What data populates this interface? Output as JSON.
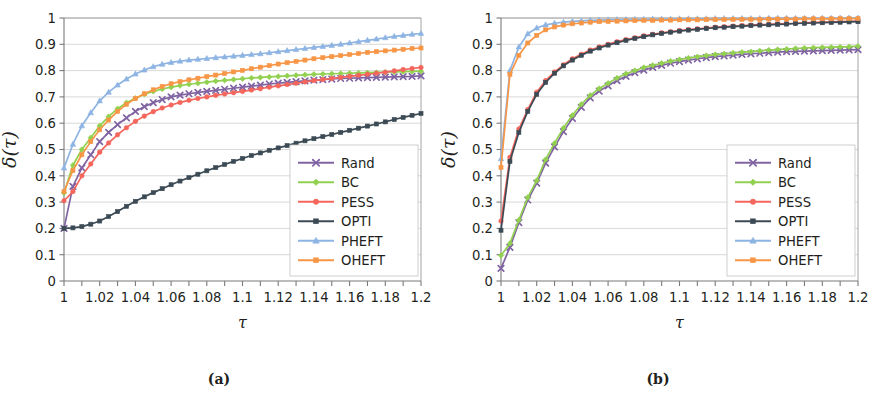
{
  "figure": {
    "panels": [
      {
        "id": "a",
        "caption": "(a)"
      },
      {
        "id": "b",
        "caption": "(b)"
      }
    ]
  },
  "axes": {
    "xlabel": "τ",
    "ylabel": "δ(τ)",
    "x_tick_labels": [
      "1",
      "1.02",
      "1.04",
      "1.06",
      "1.08",
      "1.1",
      "1.12",
      "1.14",
      "1.16",
      "1.18",
      "1.2"
    ],
    "x_tick_values": [
      1,
      1.02,
      1.04,
      1.06,
      1.08,
      1.1,
      1.12,
      1.14,
      1.16,
      1.18,
      1.2
    ],
    "y_tick_labels": [
      "0",
      "0.1",
      "0.2",
      "0.3",
      "0.4",
      "0.5",
      "0.6",
      "0.7",
      "0.8",
      "0.9",
      "1"
    ],
    "y_tick_values": [
      0,
      0.1,
      0.2,
      0.3,
      0.4,
      0.5,
      0.6,
      0.7,
      0.8,
      0.9,
      1
    ],
    "xlim": [
      1,
      1.2
    ],
    "ylim": [
      0,
      1
    ],
    "minor_x_step": 0.01
  },
  "legend": {
    "position": "bottom-right",
    "entries": [
      {
        "label": "Rand",
        "color": "#8064a2",
        "marker": "x"
      },
      {
        "label": "BC",
        "color": "#92d050",
        "marker": "diamond"
      },
      {
        "label": "PESS",
        "color": "#f4665c",
        "marker": "circle"
      },
      {
        "label": "OPTI",
        "color": "#3b4a54",
        "marker": "square"
      },
      {
        "label": "PHEFT",
        "color": "#8db4e2",
        "marker": "triangle"
      },
      {
        "label": "OHEFT",
        "color": "#f79646",
        "marker": "square"
      }
    ]
  },
  "chart_data": [
    {
      "type": "line",
      "panel": "(a)",
      "title": "",
      "xlabel": "τ",
      "ylabel": "δ(τ)",
      "xlim": [
        1,
        1.2
      ],
      "ylim": [
        0,
        1
      ],
      "grid": true,
      "legend_position": "bottom-right",
      "x": [
        1,
        1.005,
        1.01,
        1.015,
        1.02,
        1.025,
        1.03,
        1.035,
        1.04,
        1.045,
        1.05,
        1.055,
        1.06,
        1.065,
        1.07,
        1.075,
        1.08,
        1.085,
        1.09,
        1.095,
        1.1,
        1.105,
        1.11,
        1.115,
        1.12,
        1.125,
        1.13,
        1.135,
        1.14,
        1.145,
        1.15,
        1.155,
        1.16,
        1.165,
        1.17,
        1.175,
        1.18,
        1.185,
        1.19,
        1.195,
        1.2
      ],
      "series": [
        {
          "name": "Rand",
          "color": "#8064a2",
          "marker": "x",
          "values": [
            0.2,
            0.36,
            0.43,
            0.48,
            0.53,
            0.565,
            0.595,
            0.62,
            0.645,
            0.663,
            0.678,
            0.69,
            0.7,
            0.707,
            0.712,
            0.717,
            0.721,
            0.725,
            0.729,
            0.733,
            0.737,
            0.741,
            0.745,
            0.749,
            0.752,
            0.755,
            0.758,
            0.761,
            0.764,
            0.766,
            0.768,
            0.77,
            0.771,
            0.772,
            0.773,
            0.774,
            0.775,
            0.776,
            0.777,
            0.778,
            0.78
          ]
        },
        {
          "name": "BC",
          "color": "#92d050",
          "marker": "diamond",
          "values": [
            0.335,
            0.44,
            0.5,
            0.545,
            0.59,
            0.625,
            0.655,
            0.678,
            0.695,
            0.71,
            0.721,
            0.73,
            0.737,
            0.743,
            0.748,
            0.752,
            0.756,
            0.76,
            0.763,
            0.766,
            0.769,
            0.772,
            0.774,
            0.776,
            0.778,
            0.78,
            0.782,
            0.784,
            0.786,
            0.787,
            0.788,
            0.789,
            0.79,
            0.791,
            0.792,
            0.793,
            0.794,
            0.795,
            0.796,
            0.797,
            0.798
          ]
        },
        {
          "name": "PESS",
          "color": "#f4665c",
          "marker": "circle",
          "values": [
            0.305,
            0.34,
            0.4,
            0.445,
            0.49,
            0.525,
            0.556,
            0.583,
            0.607,
            0.627,
            0.644,
            0.658,
            0.669,
            0.679,
            0.687,
            0.694,
            0.7,
            0.706,
            0.711,
            0.716,
            0.721,
            0.726,
            0.731,
            0.737,
            0.742,
            0.747,
            0.752,
            0.757,
            0.762,
            0.766,
            0.77,
            0.774,
            0.778,
            0.782,
            0.786,
            0.79,
            0.794,
            0.799,
            0.804,
            0.808,
            0.812
          ]
        },
        {
          "name": "OPTI",
          "color": "#3b4a54",
          "marker": "square",
          "values": [
            0.2,
            0.202,
            0.207,
            0.216,
            0.228,
            0.245,
            0.264,
            0.284,
            0.303,
            0.32,
            0.336,
            0.351,
            0.366,
            0.38,
            0.393,
            0.406,
            0.419,
            0.431,
            0.443,
            0.455,
            0.466,
            0.477,
            0.487,
            0.497,
            0.506,
            0.515,
            0.524,
            0.533,
            0.541,
            0.549,
            0.557,
            0.565,
            0.573,
            0.581,
            0.589,
            0.597,
            0.605,
            0.614,
            0.622,
            0.63,
            0.637
          ]
        },
        {
          "name": "PHEFT",
          "color": "#8db4e2",
          "marker": "triangle",
          "values": [
            0.43,
            0.52,
            0.59,
            0.64,
            0.685,
            0.718,
            0.745,
            0.768,
            0.787,
            0.802,
            0.815,
            0.824,
            0.831,
            0.836,
            0.84,
            0.843,
            0.846,
            0.849,
            0.852,
            0.855,
            0.858,
            0.861,
            0.864,
            0.868,
            0.872,
            0.876,
            0.88,
            0.884,
            0.888,
            0.892,
            0.896,
            0.9,
            0.905,
            0.91,
            0.915,
            0.92,
            0.925,
            0.93,
            0.934,
            0.938,
            0.941
          ]
        },
        {
          "name": "OHEFT",
          "color": "#f79646",
          "marker": "square",
          "values": [
            0.34,
            0.42,
            0.48,
            0.53,
            0.575,
            0.612,
            0.645,
            0.672,
            0.694,
            0.712,
            0.727,
            0.74,
            0.75,
            0.758,
            0.765,
            0.771,
            0.777,
            0.783,
            0.789,
            0.795,
            0.801,
            0.807,
            0.813,
            0.819,
            0.825,
            0.83,
            0.835,
            0.84,
            0.845,
            0.849,
            0.853,
            0.857,
            0.861,
            0.865,
            0.869,
            0.872,
            0.875,
            0.878,
            0.881,
            0.884,
            0.886
          ]
        }
      ]
    },
    {
      "type": "line",
      "panel": "(b)",
      "title": "",
      "xlabel": "τ",
      "ylabel": "δ(τ)",
      "xlim": [
        1,
        1.2
      ],
      "ylim": [
        0,
        1
      ],
      "grid": true,
      "legend_position": "bottom-right",
      "x": [
        1,
        1.005,
        1.01,
        1.015,
        1.02,
        1.025,
        1.03,
        1.035,
        1.04,
        1.045,
        1.05,
        1.055,
        1.06,
        1.065,
        1.07,
        1.075,
        1.08,
        1.085,
        1.09,
        1.095,
        1.1,
        1.105,
        1.11,
        1.115,
        1.12,
        1.125,
        1.13,
        1.135,
        1.14,
        1.145,
        1.15,
        1.155,
        1.16,
        1.165,
        1.17,
        1.175,
        1.18,
        1.185,
        1.19,
        1.195,
        1.2
      ],
      "series": [
        {
          "name": "Rand",
          "color": "#8064a2",
          "marker": "x",
          "values": [
            0.048,
            0.128,
            0.222,
            0.308,
            0.372,
            0.448,
            0.51,
            0.568,
            0.618,
            0.66,
            0.696,
            0.722,
            0.742,
            0.762,
            0.778,
            0.792,
            0.802,
            0.812,
            0.82,
            0.828,
            0.834,
            0.84,
            0.845,
            0.849,
            0.853,
            0.856,
            0.859,
            0.862,
            0.864,
            0.866,
            0.868,
            0.87,
            0.872,
            0.873,
            0.874,
            0.875,
            0.876,
            0.877,
            0.878,
            0.879,
            0.88
          ]
        },
        {
          "name": "BC",
          "color": "#92d050",
          "marker": "diamond",
          "values": [
            0.097,
            0.143,
            0.232,
            0.318,
            0.382,
            0.462,
            0.524,
            0.582,
            0.63,
            0.672,
            0.706,
            0.732,
            0.752,
            0.772,
            0.788,
            0.8,
            0.812,
            0.82,
            0.828,
            0.836,
            0.842,
            0.848,
            0.853,
            0.857,
            0.861,
            0.864,
            0.867,
            0.87,
            0.872,
            0.875,
            0.878,
            0.88,
            0.882,
            0.884,
            0.886,
            0.887,
            0.888,
            0.889,
            0.89,
            0.891,
            0.893
          ]
        },
        {
          "name": "PESS",
          "color": "#f4665c",
          "marker": "circle",
          "values": [
            0.228,
            0.47,
            0.578,
            0.652,
            0.718,
            0.762,
            0.795,
            0.822,
            0.845,
            0.862,
            0.878,
            0.89,
            0.9,
            0.91,
            0.918,
            0.925,
            0.932,
            0.938,
            0.944,
            0.948,
            0.952,
            0.956,
            0.959,
            0.962,
            0.965,
            0.967,
            0.969,
            0.971,
            0.973,
            0.975,
            0.976,
            0.978,
            0.979,
            0.98,
            0.982,
            0.983,
            0.984,
            0.985,
            0.986,
            0.987,
            0.988
          ]
        },
        {
          "name": "OPTI",
          "color": "#3b4a54",
          "marker": "square",
          "values": [
            0.193,
            0.455,
            0.565,
            0.645,
            0.71,
            0.755,
            0.79,
            0.818,
            0.84,
            0.858,
            0.874,
            0.886,
            0.897,
            0.906,
            0.915,
            0.922,
            0.929,
            0.936,
            0.941,
            0.946,
            0.95,
            0.954,
            0.957,
            0.96,
            0.963,
            0.965,
            0.967,
            0.969,
            0.971,
            0.973,
            0.974,
            0.976,
            0.977,
            0.979,
            0.98,
            0.981,
            0.982,
            0.983,
            0.984,
            0.985,
            0.986
          ]
        },
        {
          "name": "PHEFT",
          "color": "#8db4e2",
          "marker": "triangle",
          "values": [
            0.465,
            0.8,
            0.89,
            0.94,
            0.962,
            0.974,
            0.98,
            0.984,
            0.987,
            0.989,
            0.991,
            0.992,
            0.993,
            0.994,
            0.994,
            0.995,
            0.995,
            0.996,
            0.996,
            0.996,
            0.997,
            0.997,
            0.997,
            0.997,
            0.998,
            0.998,
            0.998,
            0.998,
            0.998,
            0.998,
            0.999,
            0.999,
            0.999,
            0.999,
            0.999,
            0.999,
            0.999,
            0.999,
            1.0,
            1.0,
            1.0
          ]
        },
        {
          "name": "OHEFT",
          "color": "#f79646",
          "marker": "square",
          "values": [
            0.432,
            0.786,
            0.858,
            0.905,
            0.934,
            0.955,
            0.966,
            0.973,
            0.978,
            0.981,
            0.984,
            0.986,
            0.987,
            0.988,
            0.989,
            0.99,
            0.991,
            0.991,
            0.992,
            0.992,
            0.993,
            0.993,
            0.993,
            0.994,
            0.994,
            0.994,
            0.995,
            0.995,
            0.995,
            0.995,
            0.996,
            0.996,
            0.996,
            0.996,
            0.997,
            0.997,
            0.997,
            0.997,
            0.998,
            0.998,
            0.998
          ]
        }
      ]
    }
  ]
}
